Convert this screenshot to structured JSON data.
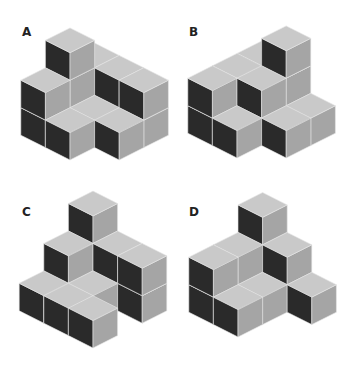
{
  "colors": {
    "top": "#c9c9c9",
    "right": "#a5a5a5",
    "left": "#2a2a2a",
    "edge": "#e6e6e6"
  },
  "projection": {
    "w": 24.6,
    "h": 12.4,
    "d": 27.5
  },
  "figures": [
    {
      "label": "A",
      "label_pos": [
        22,
        36
      ],
      "origin": [
        70,
        160
      ],
      "voxels": [
        [
          0,
          0,
          0
        ],
        [
          1,
          -1,
          0
        ],
        [
          1,
          0,
          0
        ],
        [
          0,
          1,
          0
        ],
        [
          0,
          1,
          1
        ],
        [
          1,
          1,
          0
        ],
        [
          1,
          1,
          1
        ],
        [
          1,
          1,
          2
        ],
        [
          2,
          0,
          0
        ],
        [
          2,
          0,
          1
        ],
        [
          2,
          -1,
          0
        ],
        [
          2,
          -1,
          1
        ],
        [
          2,
          1,
          0
        ],
        [
          2,
          1,
          1
        ]
      ]
    },
    {
      "label": "B",
      "label_pos": [
        189,
        36
      ],
      "origin": [
        237,
        158
      ],
      "voxels": [
        [
          0,
          0,
          0
        ],
        [
          1,
          -1,
          0
        ],
        [
          2,
          -1,
          0
        ],
        [
          0,
          1,
          0
        ],
        [
          0,
          1,
          1
        ],
        [
          1,
          0,
          0
        ],
        [
          1,
          0,
          1
        ],
        [
          1,
          1,
          0
        ],
        [
          1,
          1,
          1
        ],
        [
          2,
          0,
          0
        ],
        [
          2,
          0,
          1
        ],
        [
          2,
          0,
          2
        ],
        [
          2,
          1,
          0
        ],
        [
          2,
          1,
          1
        ]
      ]
    },
    {
      "label": "C",
      "label_pos": [
        22,
        216
      ],
      "origin": [
        93,
        348
      ],
      "voxels": [
        [
          0,
          0,
          0
        ],
        [
          0,
          1,
          0
        ],
        [
          0,
          2,
          0
        ],
        [
          1,
          1,
          0
        ],
        [
          1,
          2,
          0
        ],
        [
          1,
          2,
          1
        ],
        [
          2,
          0,
          0
        ],
        [
          2,
          0,
          1
        ],
        [
          2,
          1,
          0
        ],
        [
          2,
          1,
          1
        ],
        [
          2,
          2,
          0
        ],
        [
          2,
          2,
          1
        ],
        [
          2,
          2,
          2
        ]
      ]
    },
    {
      "label": "D",
      "label_pos": [
        189,
        216
      ],
      "origin": [
        238,
        337
      ],
      "voxels": [
        [
          0,
          0,
          0
        ],
        [
          0,
          1,
          0
        ],
        [
          0,
          1,
          1
        ],
        [
          1,
          0,
          0
        ],
        [
          1,
          1,
          0
        ],
        [
          1,
          1,
          1
        ],
        [
          2,
          -1,
          0
        ],
        [
          2,
          0,
          0
        ],
        [
          2,
          0,
          1
        ],
        [
          2,
          1,
          0
        ],
        [
          2,
          1,
          1
        ],
        [
          2,
          1,
          2
        ]
      ]
    }
  ]
}
